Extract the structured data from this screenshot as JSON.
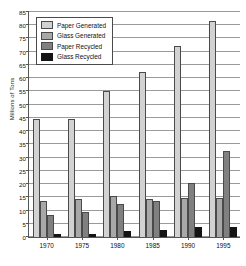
{
  "chart_data": {
    "type": "bar",
    "title": "",
    "xlabel": "",
    "ylabel": "Millions of Tons",
    "categories": [
      "1970",
      "1975",
      "1980",
      "1985",
      "1990",
      "1995"
    ],
    "ylim": [
      0,
      85
    ],
    "ytick_step": 5,
    "yticks": [
      0,
      5,
      10,
      15,
      20,
      25,
      30,
      35,
      40,
      45,
      50,
      55,
      60,
      65,
      70,
      75,
      80,
      85
    ],
    "grid": true,
    "legend_position": "top-left-inside",
    "series": [
      {
        "name": "Paper Generated",
        "color": "#d2d2d2",
        "values": [
          44.5,
          44.6,
          55.2,
          62.3,
          72.3,
          81.5
        ]
      },
      {
        "name": "Glass Generated",
        "color": "#a8a8a8",
        "values": [
          13.5,
          14.3,
          15.5,
          14.5,
          14.6,
          14.7
        ]
      },
      {
        "name": "Paper Recycled",
        "color": "#808080",
        "values": [
          8.5,
          9.5,
          12.5,
          13.5,
          20.5,
          32.5
        ]
      },
      {
        "name": "Glass Recycled",
        "color": "#141414",
        "values": [
          1.3,
          1.3,
          2.3,
          2.7,
          3.7,
          3.9
        ]
      }
    ]
  }
}
